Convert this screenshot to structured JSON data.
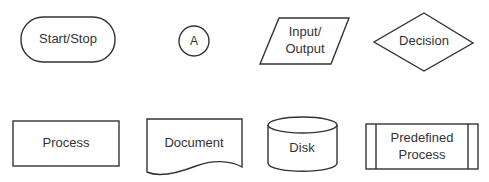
{
  "diagram": {
    "colors": {
      "stroke": "#333333",
      "fill": "#ffffff",
      "text": "#333333",
      "background": "#ffffff"
    },
    "symbols": [
      {
        "id": "start-stop",
        "shape": "terminator",
        "lines": [
          "Start/Stop"
        ]
      },
      {
        "id": "connector",
        "shape": "circle",
        "lines": [
          "A"
        ]
      },
      {
        "id": "input-output",
        "shape": "parallelogram",
        "lines": [
          "Input/",
          "Output"
        ]
      },
      {
        "id": "decision",
        "shape": "diamond",
        "lines": [
          "Decision"
        ]
      },
      {
        "id": "process",
        "shape": "rectangle",
        "lines": [
          "Process"
        ]
      },
      {
        "id": "document",
        "shape": "document",
        "lines": [
          "Document"
        ]
      },
      {
        "id": "disk",
        "shape": "cylinder",
        "lines": [
          "Disk"
        ]
      },
      {
        "id": "predefined-process",
        "shape": "predefined-process",
        "lines": [
          "Predefined",
          "Process"
        ]
      }
    ]
  }
}
